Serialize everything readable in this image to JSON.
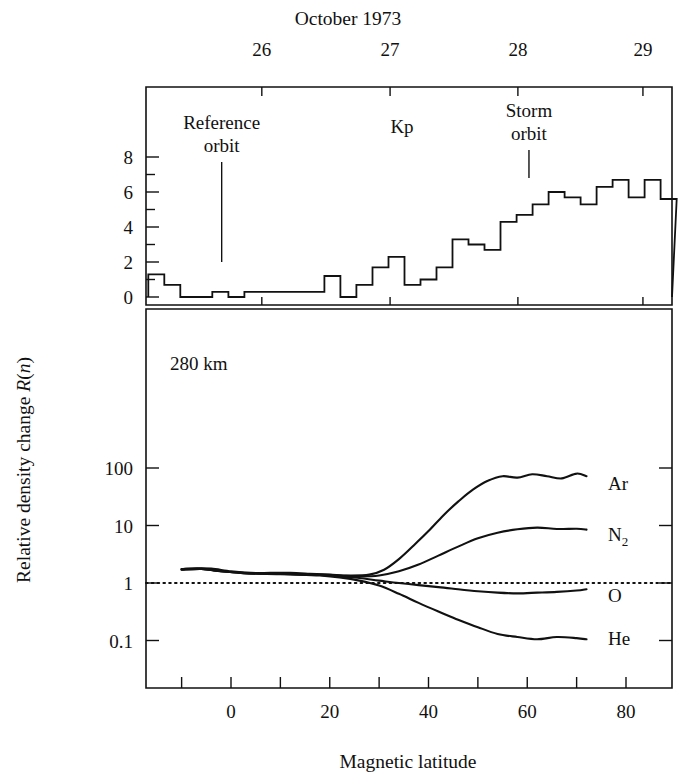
{
  "figure": {
    "top_axis_title": "October 1973",
    "bottom_axis_title": "Magnetic latitude",
    "left_axis_title_prefix": "Relative density change ",
    "left_axis_title_var": "R",
    "left_axis_title_arg": "(n)",
    "altitude_annotation": "280 km"
  },
  "annotations": {
    "reference_orbit_line1": "Reference",
    "reference_orbit_line2": "orbit",
    "kp_label": "Kp",
    "storm_orbit_line1": "Storm",
    "storm_orbit_line2": "orbit",
    "reference_orbit_x": 2.4,
    "storm_orbit_x": 69.0
  },
  "top_panel": {
    "x_tick_labels": [
      "26",
      "27",
      "28",
      "29"
    ],
    "x_tick_values": [
      11.1,
      38.9,
      66.6,
      93.7
    ],
    "y_tick_labels": [
      "0",
      "2",
      "4",
      "6",
      "8"
    ],
    "y_tick_values": [
      0,
      2,
      4,
      6,
      8
    ],
    "y_minor_values": [
      1,
      3,
      5,
      7
    ],
    "ylim": [
      0,
      9.2
    ]
  },
  "bottom_panel": {
    "x_tick_labels": [
      "0",
      "20",
      "40",
      "60",
      "80"
    ],
    "x_tick_values": [
      0,
      20,
      40,
      60,
      80
    ],
    "x_minor_values": [
      -10,
      10,
      30,
      50,
      70,
      90
    ],
    "y_tick_labels": [
      "100",
      "10",
      "1",
      "0.1"
    ],
    "y_tick_values": [
      100,
      10,
      1,
      0.1
    ],
    "unity_reference": 1,
    "series_labels": [
      "Ar",
      "N",
      "O",
      "He"
    ],
    "n2_label_base": "N",
    "n2_label_sub": "2"
  },
  "chart_data": {
    "type": "line",
    "xlabel": "Magnetic latitude",
    "ylabel": "Relative density change R(n)",
    "panels": [
      {
        "name": "Kp index histogram",
        "type": "bar",
        "ylabel": "Kp",
        "ylim": [
          0,
          9.2
        ],
        "xlabel": "October 1973",
        "xlim": [
          -14,
          100
        ],
        "bin_width": 3.47,
        "bin_start": -13.5,
        "values": [
          1.3,
          0.7,
          0.0,
          0.0,
          0.3,
          0.0,
          0.3,
          0.3,
          0.3,
          0.3,
          0.3,
          1.2,
          0.0,
          0.7,
          1.7,
          2.3,
          0.7,
          1.0,
          1.7,
          3.3,
          3.0,
          2.7,
          4.3,
          4.7,
          5.3,
          6.0,
          5.7,
          5.3,
          6.3,
          6.7,
          5.7,
          6.7,
          5.6
        ]
      },
      {
        "name": "Relative density change by species",
        "type": "line",
        "xlabel": "Magnetic latitude",
        "ylabel": "Relative density change R(n)",
        "yscale": "log",
        "ylim": [
          0.055,
          450
        ],
        "xlim": [
          -14,
          93
        ],
        "series": [
          {
            "name": "Ar",
            "x": [
              -10,
              -7,
              -4,
              0,
              4,
              8,
              12,
              16,
              20,
              24,
              28,
              31,
              34,
              37,
              40,
              43,
              46,
              49,
              52,
              55,
              58,
              61,
              64,
              67,
              70,
              72
            ],
            "y": [
              1.75,
              1.8,
              1.78,
              1.6,
              1.5,
              1.5,
              1.5,
              1.45,
              1.4,
              1.35,
              1.4,
              1.7,
              2.6,
              4.5,
              8.0,
              15,
              26,
              42,
              60,
              72,
              68,
              78,
              72,
              66,
              80,
              72
            ]
          },
          {
            "name": "N2",
            "x": [
              -10,
              -6,
              -2,
              2,
              6,
              10,
              14,
              18,
              22,
              26,
              30,
              34,
              38,
              42,
              46,
              50,
              54,
              58,
              62,
              66,
              70,
              72
            ],
            "y": [
              1.7,
              1.75,
              1.6,
              1.5,
              1.45,
              1.45,
              1.42,
              1.4,
              1.35,
              1.3,
              1.35,
              1.6,
              2.1,
              3.0,
              4.3,
              6.0,
              7.5,
              8.6,
              9.2,
              8.7,
              8.8,
              8.5
            ]
          },
          {
            "name": "O",
            "x": [
              -10,
              -6,
              -2,
              2,
              6,
              10,
              14,
              18,
              22,
              26,
              30,
              34,
              38,
              42,
              46,
              50,
              54,
              58,
              62,
              66,
              70,
              72
            ],
            "y": [
              1.75,
              1.78,
              1.6,
              1.5,
              1.45,
              1.45,
              1.4,
              1.38,
              1.3,
              1.22,
              1.1,
              1.0,
              0.92,
              0.85,
              0.78,
              0.72,
              0.68,
              0.66,
              0.68,
              0.7,
              0.74,
              0.78
            ]
          },
          {
            "name": "He",
            "x": [
              -10,
              -6,
              -2,
              2,
              6,
              10,
              14,
              18,
              22,
              26,
              30,
              34,
              38,
              42,
              46,
              50,
              54,
              58,
              62,
              66,
              70,
              72
            ],
            "y": [
              1.7,
              1.75,
              1.6,
              1.5,
              1.45,
              1.42,
              1.4,
              1.35,
              1.25,
              1.1,
              0.9,
              0.65,
              0.45,
              0.32,
              0.23,
              0.17,
              0.13,
              0.115,
              0.105,
              0.115,
              0.11,
              0.105
            ]
          }
        ],
        "reference_line": {
          "y": 1,
          "style": "dotted"
        }
      }
    ]
  }
}
